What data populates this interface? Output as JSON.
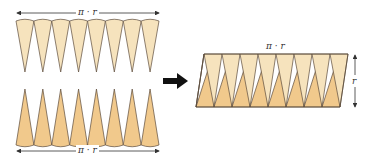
{
  "labels": {
    "top_width": "π · r",
    "bottom_width": "π · r",
    "result_width": "π · r",
    "result_height": "r"
  },
  "colors": {
    "light_sector": "#f6e3bd",
    "dark_sector": "#f1c98c",
    "outline": "#5b4b3b",
    "arrow": "#111111",
    "dimension_line": "#333333"
  },
  "sector_count_per_row": 8
}
